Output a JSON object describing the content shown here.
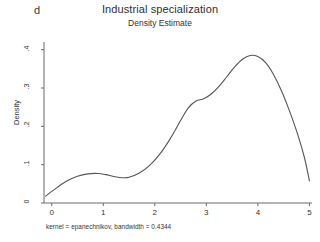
{
  "panel": {
    "label": "d"
  },
  "chart_data": {
    "type": "line",
    "title": "Industrial specialization",
    "subtitle": "Density Estimate",
    "xlabel": "",
    "ylabel": "Density",
    "xlim": [
      -0.15,
      5.05
    ],
    "ylim": [
      0,
      0.42
    ],
    "xticks": [
      "0",
      "1",
      "2",
      "3",
      "4",
      "5"
    ],
    "xtick_values": [
      0,
      1,
      2,
      3,
      4,
      5
    ],
    "yticks": [
      "0",
      ".1",
      ".2",
      ".3",
      ".4"
    ],
    "ytick_values": [
      0,
      0.1,
      0.2,
      0.3,
      0.4
    ],
    "grid": false,
    "legend": null,
    "line_color": "#555555",
    "note": "kernel = epanechnikov, bandwidth = 0.4344",
    "series": [
      {
        "name": "Density Estimate",
        "x": [
          -0.12,
          0.1,
          0.3,
          0.5,
          0.7,
          0.9,
          1.05,
          1.2,
          1.35,
          1.5,
          1.7,
          1.9,
          2.1,
          2.3,
          2.5,
          2.65,
          2.8,
          2.95,
          3.1,
          3.25,
          3.4,
          3.55,
          3.7,
          3.85,
          4.0,
          4.15,
          4.3,
          4.45,
          4.6,
          4.75,
          4.9,
          5.0
        ],
        "y": [
          0.018,
          0.04,
          0.058,
          0.07,
          0.076,
          0.077,
          0.074,
          0.069,
          0.066,
          0.067,
          0.078,
          0.098,
          0.128,
          0.168,
          0.215,
          0.248,
          0.266,
          0.272,
          0.285,
          0.305,
          0.33,
          0.355,
          0.375,
          0.385,
          0.382,
          0.366,
          0.336,
          0.295,
          0.245,
          0.188,
          0.12,
          0.058
        ]
      }
    ]
  }
}
